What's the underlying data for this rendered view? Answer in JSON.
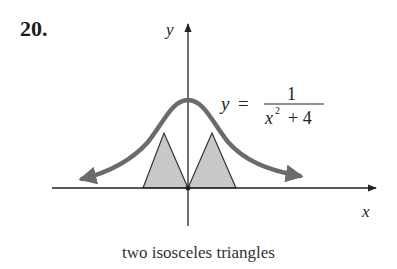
{
  "problem": {
    "number": "20."
  },
  "figure": {
    "axis_labels": {
      "x": "x",
      "y": "y"
    },
    "equation": {
      "lhs": "y",
      "equals": "=",
      "numerator": "1",
      "denominator_base": "x",
      "denominator_exponent": "2",
      "denominator_rest": "+ 4"
    },
    "colors": {
      "curve": "#6b6b6b",
      "triangle_fill": "#c8c8c8",
      "axis": "#222222"
    }
  },
  "caption": "two isosceles triangles"
}
